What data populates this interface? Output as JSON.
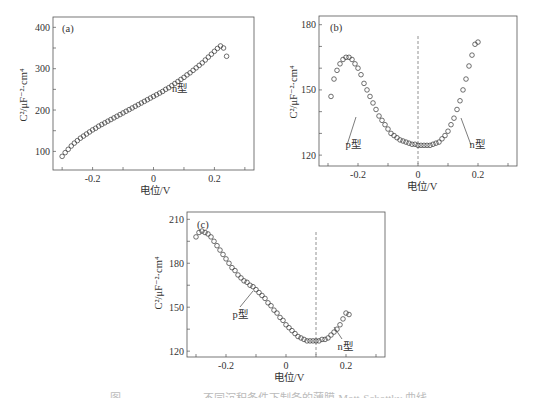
{
  "chart_data": [
    {
      "panel": "(a)",
      "type": "scatter",
      "marker": "open-circle",
      "xlabel": "电位/V",
      "ylabel": "C²/μF⁻²·cm⁴",
      "xlim": [
        -0.33,
        0.33
      ],
      "ylim": [
        55,
        425
      ],
      "xticks": [
        -0.3,
        -0.2,
        -0.1,
        0,
        0.1,
        0.2,
        0.3
      ],
      "xtick_labels": [
        "",
        "-0.2",
        "",
        "0",
        "",
        "0.2",
        ""
      ],
      "yticks": [
        100,
        150,
        200,
        250,
        300,
        350,
        400
      ],
      "ytick_labels": [
        "100",
        "",
        "200",
        "",
        "300",
        "",
        "400"
      ],
      "annotations": [
        {
          "text": "n型",
          "x": 0.05,
          "y": 245
        }
      ],
      "x": [
        -0.3,
        -0.29,
        -0.28,
        -0.27,
        -0.26,
        -0.25,
        -0.24,
        -0.23,
        -0.22,
        -0.21,
        -0.2,
        -0.19,
        -0.18,
        -0.17,
        -0.16,
        -0.15,
        -0.14,
        -0.13,
        -0.12,
        -0.11,
        -0.1,
        -0.09,
        -0.08,
        -0.07,
        -0.06,
        -0.05,
        -0.04,
        -0.03,
        -0.02,
        -0.01,
        0.0,
        0.01,
        0.02,
        0.03,
        0.04,
        0.05,
        0.06,
        0.07,
        0.08,
        0.09,
        0.1,
        0.11,
        0.12,
        0.13,
        0.14,
        0.15,
        0.16,
        0.17,
        0.18,
        0.19,
        0.2,
        0.21,
        0.22,
        0.23,
        0.24
      ],
      "y": [
        88,
        97,
        105,
        113,
        120,
        126,
        132,
        137,
        142,
        147,
        152,
        156,
        161,
        165,
        169,
        173,
        177,
        181,
        185,
        189,
        193,
        197,
        201,
        205,
        209,
        213,
        217,
        221,
        225,
        229,
        233,
        237,
        241,
        245,
        250,
        254,
        259,
        264,
        269,
        274,
        279,
        285,
        290,
        296,
        302,
        308,
        314,
        321,
        328,
        335,
        342,
        349,
        355,
        350,
        330
      ]
    },
    {
      "panel": "(b)",
      "type": "scatter",
      "marker": "open-circle",
      "xlabel": "电位/V",
      "ylabel": "C²/μF⁻²·cm⁴",
      "xlim": [
        -0.33,
        0.33
      ],
      "ylim": [
        115,
        184
      ],
      "xticks": [
        -0.3,
        -0.2,
        -0.1,
        0,
        0.1,
        0.2,
        0.3
      ],
      "xtick_labels": [
        "",
        "-0.2",
        "",
        "0",
        "",
        "0.2",
        ""
      ],
      "yticks": [
        120,
        130,
        140,
        150,
        160,
        170,
        180
      ],
      "ytick_labels": [
        "120",
        "",
        "",
        "150",
        "",
        "",
        "180"
      ],
      "vline": 0,
      "annotations": [
        {
          "text": "p型",
          "x": -0.19,
          "y": 124
        },
        {
          "text": "n型",
          "x": 0.19,
          "y": 124
        }
      ],
      "x": [
        -0.29,
        -0.28,
        -0.27,
        -0.26,
        -0.25,
        -0.24,
        -0.23,
        -0.22,
        -0.21,
        -0.2,
        -0.19,
        -0.18,
        -0.17,
        -0.16,
        -0.15,
        -0.14,
        -0.13,
        -0.12,
        -0.11,
        -0.1,
        -0.09,
        -0.08,
        -0.07,
        -0.06,
        -0.05,
        -0.04,
        -0.03,
        -0.02,
        -0.01,
        0.0,
        0.01,
        0.02,
        0.03,
        0.04,
        0.05,
        0.06,
        0.07,
        0.08,
        0.09,
        0.1,
        0.11,
        0.12,
        0.13,
        0.14,
        0.15,
        0.16,
        0.17,
        0.18,
        0.19,
        0.2
      ],
      "y": [
        147,
        155,
        159,
        162,
        164,
        165,
        165,
        164,
        162,
        160,
        157,
        153,
        150,
        147,
        144,
        141,
        138,
        136,
        134,
        132,
        130,
        129,
        128,
        127,
        126.5,
        126,
        125.5,
        125,
        125,
        124.5,
        124.5,
        124.5,
        124.5,
        124.5,
        125,
        125.5,
        126,
        127.5,
        129,
        131,
        134,
        137,
        141,
        145,
        150,
        155,
        161,
        166,
        171,
        172,
        158
      ]
    },
    {
      "panel": "(c)",
      "type": "scatter",
      "marker": "open-circle",
      "xlabel": "电位/V",
      "ylabel": "C²/μF⁻²·cm⁴",
      "xlim": [
        -0.33,
        0.33
      ],
      "ylim": [
        116,
        215
      ],
      "xticks": [
        -0.3,
        -0.2,
        -0.1,
        0,
        0.1,
        0.2,
        0.3
      ],
      "xtick_labels": [
        "",
        "-0.2",
        "",
        "0",
        "",
        "0.2",
        ""
      ],
      "yticks": [
        120,
        135,
        150,
        165,
        180,
        195,
        210
      ],
      "ytick_labels": [
        "120",
        "",
        "150",
        "",
        "180",
        "",
        "210"
      ],
      "vline": 0.1,
      "annotations": [
        {
          "text": "p型",
          "x": -0.14,
          "y": 147
        },
        {
          "text": "n型",
          "x": 0.2,
          "y": 124
        }
      ],
      "x": [
        -0.3,
        -0.29,
        -0.28,
        -0.27,
        -0.26,
        -0.25,
        -0.24,
        -0.23,
        -0.22,
        -0.21,
        -0.2,
        -0.19,
        -0.18,
        -0.17,
        -0.16,
        -0.15,
        -0.14,
        -0.13,
        -0.12,
        -0.11,
        -0.1,
        -0.09,
        -0.08,
        -0.07,
        -0.06,
        -0.05,
        -0.04,
        -0.03,
        -0.02,
        -0.01,
        0.0,
        0.01,
        0.02,
        0.03,
        0.04,
        0.05,
        0.06,
        0.07,
        0.08,
        0.09,
        0.1,
        0.11,
        0.12,
        0.13,
        0.14,
        0.15,
        0.16,
        0.17,
        0.18,
        0.19,
        0.2,
        0.21
      ],
      "y": [
        198,
        201,
        202,
        201,
        200,
        198,
        195,
        192,
        189,
        186,
        183,
        180,
        177,
        175,
        172,
        170,
        168,
        167,
        165,
        164,
        162,
        160,
        158,
        156,
        153,
        151,
        148,
        146,
        143,
        141,
        138,
        136,
        134,
        132,
        130,
        129,
        128,
        127,
        127,
        127,
        127,
        127,
        128,
        128,
        129,
        131,
        133,
        135,
        138,
        142,
        146,
        145
      ]
    }
  ],
  "panels": {
    "a": {
      "tag": "(a)",
      "xlabel": "电位/V",
      "ylabel": "C²/μF⁻²·cm⁴",
      "annot_n": "n型"
    },
    "b": {
      "tag": "(b)",
      "xlabel": "电位/V",
      "ylabel": "C²/μF⁻²·cm⁴",
      "annot_p": "p型",
      "annot_n": "n型"
    },
    "c": {
      "tag": "(c)",
      "xlabel": "电位/V",
      "ylabel": "C²/μF⁻²·cm⁴",
      "annot_p": "p型",
      "annot_n": "n型"
    }
  },
  "caption": "图 ——————— 不同沉积条件下制备的薄膜 Mott-Schottky 曲线"
}
